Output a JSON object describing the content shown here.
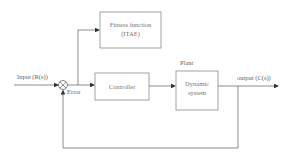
{
  "diagram": {
    "type": "feedback-control-block-diagram",
    "blocks": {
      "fitness": {
        "line1": "Fitness function",
        "line2": "(ITAE)"
      },
      "controller": {
        "label": "Controller"
      },
      "plant": {
        "title": "Plant",
        "line1": "Dynamic",
        "line2": "system"
      }
    },
    "signals": {
      "input": "Input (R(s))",
      "error": "Error",
      "output": "output (C(s))"
    },
    "colors": {
      "line": "#6e6e6e",
      "box": "#8a8a8a",
      "text": "#666666"
    }
  }
}
